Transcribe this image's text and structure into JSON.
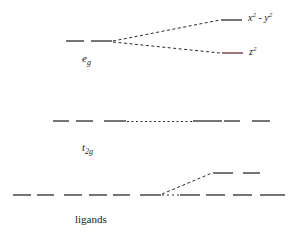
{
  "diagram": {
    "type": "energy-level-diagram",
    "levels": {
      "eg": {
        "label_main": "e",
        "label_sub": "g"
      },
      "x2y2": {
        "label_x": "x",
        "label_exp1": "2",
        "label_mid": " - y",
        "label_exp2": "2"
      },
      "z2": {
        "label_z": "z",
        "label_exp": "2"
      },
      "t2g": {
        "label_main": "t",
        "label_sub": "2g"
      },
      "ligands": {
        "label": "ligands"
      }
    },
    "colors": {
      "line": "#2a2a2a",
      "z2_line": "#6b2a2a"
    }
  }
}
